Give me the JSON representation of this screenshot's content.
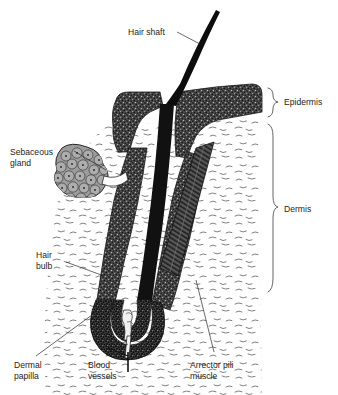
{
  "figure": {
    "type": "anatomical-diagram",
    "background_color": "#ffffff",
    "ink_color": "#1d1d1d"
  },
  "labels": {
    "hair_shaft": "Hair shaft",
    "sebaceous_gland_line1": "Sebaceous",
    "sebaceous_gland_line2": "gland",
    "hair_bulb_line1": "Hair",
    "hair_bulb_line2": "bulb",
    "dermal_papilla_line1": "Dermal",
    "dermal_papilla_line2": "papilla",
    "blood_vessels_line1": "Blood",
    "blood_vessels_line2": "vessels",
    "arrector_pili_line1": "Arrector pili",
    "arrector_pili_line2": "muscle",
    "epidermis": "Epidermis",
    "dermis": "Dermis"
  },
  "structures": {
    "epidermis": {
      "name": "Epidermis",
      "fill": "#3d3d3d",
      "description": "Dark stippled surface layer that folds down to form follicle walls"
    },
    "dermis": {
      "name": "Dermis",
      "fill": "#ffffff",
      "description": "White layer with scattered collagen fibre dashes"
    },
    "hair_shaft": {
      "name": "Hair shaft",
      "fill": "#111111",
      "description": "Dark tapering strand emerging above skin surface"
    },
    "follicle_wall": {
      "name": "Hair follicle wall",
      "fill": "#4a4a4a",
      "description": "Stippled sheath descending into dermis"
    },
    "sebaceous_gland": {
      "name": "Sebaceous gland",
      "fill": "#9a9a9a",
      "description": "Lobed cluster of polygonal cells with nuclei"
    },
    "hair_bulb": {
      "name": "Hair bulb",
      "fill": "#4a4a4a",
      "description": "Expanded U-shaped base of the follicle"
    },
    "dermal_papilla": {
      "name": "Dermal papilla",
      "fill": "#e8e8e8",
      "description": "Pale connective tissue knob inside the bulb"
    },
    "blood_vessels": {
      "name": "Blood vessels",
      "fill": "#f2f2f2",
      "description": "Vessels entering the papilla from below"
    },
    "arrector_pili_muscle": {
      "name": "Arrector pili muscle",
      "fill": "#4f4f4f",
      "description": "Dark striated diagonal band from follicle to epidermis"
    }
  },
  "brackets": {
    "epidermis_label": "Epidermis",
    "dermis_label": "Dermis"
  }
}
